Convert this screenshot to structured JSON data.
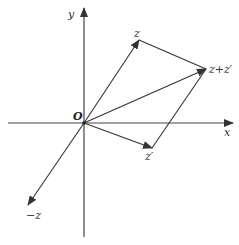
{
  "diagram": {
    "title": "",
    "type": "complex-plane vector addition (parallelogram rule)",
    "colors": {
      "line": "#333333",
      "background": "#ffffff"
    },
    "origin": {
      "label": "O",
      "x": 84,
      "y": 123
    },
    "axes": {
      "x": {
        "label": "x",
        "from": [
          8,
          123
        ],
        "to": [
          233,
          123
        ],
        "label_pos": [
          226,
          136
        ]
      },
      "y": {
        "label": "y",
        "from": [
          84,
          237
        ],
        "to": [
          84,
          8
        ],
        "label_pos": [
          70,
          18
        ]
      }
    },
    "vectors": [
      {
        "name": "z",
        "label": "z",
        "from": [
          84,
          123
        ],
        "to": [
          139,
          40
        ],
        "label_pos": [
          134,
          37
        ]
      },
      {
        "name": "z-prime",
        "label": "z′",
        "from": [
          84,
          123
        ],
        "to": [
          152,
          148
        ],
        "label_pos": [
          145,
          160
        ]
      },
      {
        "name": "z-plus-z-prime",
        "label": "z+z′",
        "from": [
          84,
          123
        ],
        "to": [
          206,
          69
        ],
        "label_pos": [
          210,
          73
        ]
      },
      {
        "name": "minus-z",
        "label": "−z",
        "from": [
          84,
          123
        ],
        "to": [
          28,
          205
        ],
        "label_pos": [
          26,
          219
        ]
      }
    ],
    "parallelogram_edges": [
      {
        "name": "z-to-sum",
        "from": [
          139,
          40
        ],
        "to": [
          206,
          69
        ]
      },
      {
        "name": "zprime-to-sum",
        "from": [
          152,
          148
        ],
        "to": [
          206,
          69
        ]
      }
    ]
  }
}
